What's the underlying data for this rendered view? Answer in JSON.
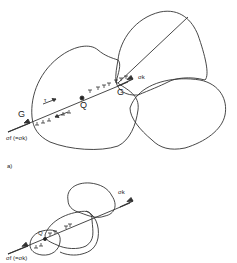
{
  "figure": {
    "panel_a": {
      "label": "a)",
      "point_G_start": "G",
      "point_Q": "Q",
      "point_G_end": "G",
      "shear_symbol": "τ",
      "stress_out": "σk",
      "stress_in": "σf (=σk)"
    },
    "panel_b": {
      "point_Q": "Q",
      "stress_out": "σk",
      "stress_in": "σf (=σk)"
    }
  }
}
